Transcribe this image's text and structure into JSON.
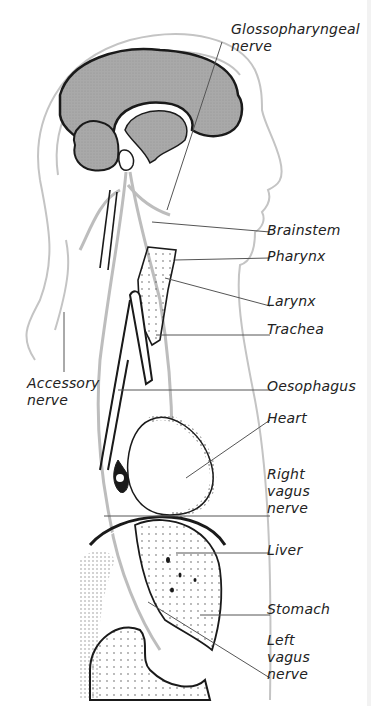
{
  "diagram": {
    "colors": {
      "outline": "#1a1a1a",
      "nerve": "#bdbdbd",
      "brain_fill": "#a9a9a9",
      "leader_line": "#555555",
      "text": "#222222"
    },
    "labels": {
      "glossopharyngeal": "Glossopharyngeal\nnerve",
      "brainstem": "Brainstem",
      "pharynx": "Pharynx",
      "larynx": "Larynx",
      "trachea": "Trachea",
      "accessory": "Accessory\nnerve",
      "oesophagus": "Oesophagus",
      "heart": "Heart",
      "right_vagus": "Right\nvagus\nnerve",
      "liver": "Liver",
      "stomach": "Stomach",
      "left_vagus": "Left\nvagus\nnerve"
    }
  }
}
